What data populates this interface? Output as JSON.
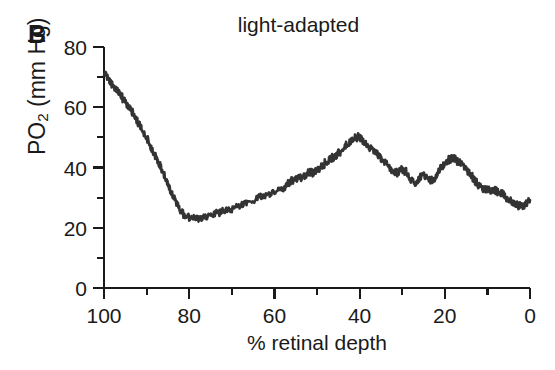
{
  "panel": {
    "label": "B"
  },
  "chart_data": {
    "type": "line",
    "title": "light-adapted",
    "xlabel": "% retinal depth",
    "ylabel": "PO2 (mm Hg)",
    "ylabel_base": "PO",
    "ylabel_sub": "2",
    "ylabel_unit": " (mm Hg)",
    "xlim": [
      100,
      0
    ],
    "ylim": [
      0,
      80
    ],
    "x_reversed": true,
    "grid": false,
    "legend": "none",
    "line_color": "#333333",
    "axis_color": "#1a1a1a",
    "xticks": [
      100,
      80,
      60,
      40,
      20,
      0
    ],
    "xtick_labels": [
      "100",
      "80",
      "60",
      "40",
      "20",
      "0"
    ],
    "x_minor_interval": 10,
    "yticks": [
      0,
      20,
      40,
      60,
      80
    ],
    "ytick_labels": [
      "0",
      "20",
      "40",
      "60",
      "80"
    ],
    "y_minor_interval": 10,
    "series": [
      {
        "name": "light-adapted PO2 profile",
        "noise_amplitude": 1.15,
        "noise_seed": 7,
        "x": [
          100,
          99,
          98,
          97,
          96,
          95,
          94,
          93,
          92,
          91,
          90,
          89,
          88,
          87,
          86,
          85,
          84,
          83,
          82,
          81,
          80,
          78,
          76,
          74,
          72,
          70,
          68,
          66,
          64,
          62,
          60,
          58,
          57,
          56,
          55,
          54,
          53,
          52,
          51,
          50,
          49,
          48,
          47,
          46,
          45,
          44,
          43,
          42,
          41,
          40,
          39,
          38,
          37,
          36,
          35,
          34,
          33,
          32,
          31,
          30,
          29,
          28,
          27,
          26,
          25,
          24,
          23,
          22,
          21,
          20,
          19,
          18,
          17,
          16,
          15,
          14,
          13,
          12,
          11,
          10,
          9,
          8,
          7,
          6,
          5,
          4,
          3,
          2,
          1,
          0
        ],
        "y": [
          72.0,
          69.5,
          67.5,
          65.8,
          63.8,
          61.5,
          59.5,
          57.5,
          55.0,
          52.5,
          50.0,
          47.0,
          44.0,
          41.0,
          38.0,
          34.5,
          31.0,
          28.0,
          25.5,
          24.2,
          23.4,
          23.0,
          23.6,
          24.4,
          25.5,
          26.6,
          27.6,
          28.6,
          29.6,
          30.8,
          32.0,
          33.2,
          34.0,
          35.6,
          36.0,
          36.6,
          37.2,
          38.4,
          38.0,
          38.8,
          40.2,
          41.6,
          42.6,
          43.6,
          44.8,
          46.2,
          47.6,
          49.0,
          49.8,
          50.0,
          48.6,
          47.0,
          45.8,
          44.6,
          43.4,
          41.8,
          40.2,
          38.8,
          38.0,
          39.6,
          38.4,
          36.2,
          35.0,
          36.4,
          38.0,
          36.0,
          35.6,
          37.4,
          39.6,
          41.4,
          42.6,
          43.0,
          42.2,
          41.0,
          39.4,
          37.6,
          35.6,
          34.0,
          33.0,
          32.6,
          32.4,
          32.2,
          31.6,
          30.6,
          29.4,
          28.2,
          27.4,
          27.0,
          27.6,
          29.2
        ]
      }
    ]
  }
}
